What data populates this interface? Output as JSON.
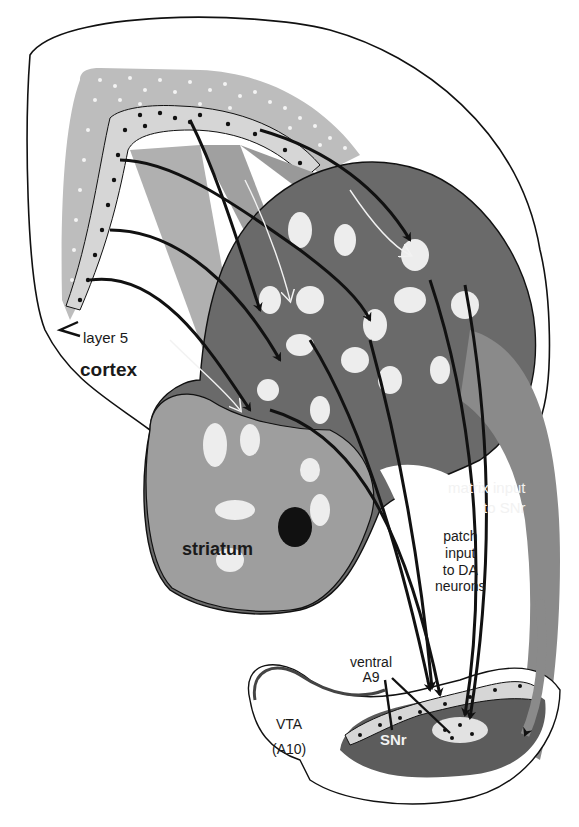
{
  "figure": {
    "type": "anatomical-schematic",
    "colors": {
      "background": "#ffffff",
      "outline": "#111111",
      "cortex_light": "#c8c8c8",
      "cortex_mid": "#a9a9a9",
      "layer5_band": "#d6d6d6",
      "striatum_light": "#9e9e9e",
      "striatum_dark": "#6a6a6a",
      "patch": "#ededed",
      "matrix_input_band": "#8a8a8a",
      "snr": "#5c5c5c",
      "snr_dark": "#3a3a3a",
      "dot": "#111111",
      "white_dot": "#f4f4f4"
    }
  },
  "labels": {
    "layer5": "layer 5",
    "cortex": "cortex",
    "striatum": "striatum",
    "matrix_input_line1": "matrix input",
    "matrix_input_line2": "to SNr",
    "patch_input_line1": "patch",
    "patch_input_line2": "input",
    "patch_input_line3": "to DA",
    "patch_input_line4": "neurons",
    "ventral_line1": "ventral",
    "ventral_line2": "A9",
    "vta_line1": "VTA",
    "vta_line2": "(A10)",
    "snr": "SNr"
  }
}
